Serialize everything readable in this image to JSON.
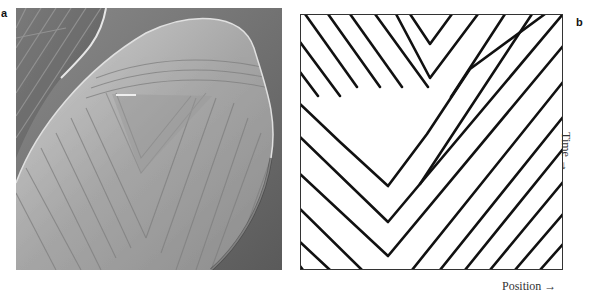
{
  "figure": {
    "panel_a": {
      "label": "a",
      "content": "Grayscale electron micrograph of a seashell with a chevron / V-shaped stripe pattern"
    },
    "panel_b": {
      "label": "b",
      "content": "Simulated stripe pattern: diagonal black stripes on white forming nested V shapes with a white gap",
      "x_axis_label": "Position →",
      "y_axis_label": "Time →"
    }
  },
  "colors": {
    "background": "#ffffff",
    "stripe": "#111111",
    "frame": "#333333",
    "photo_bg": "#6e6e6e",
    "shell": "#a8a8a8"
  }
}
